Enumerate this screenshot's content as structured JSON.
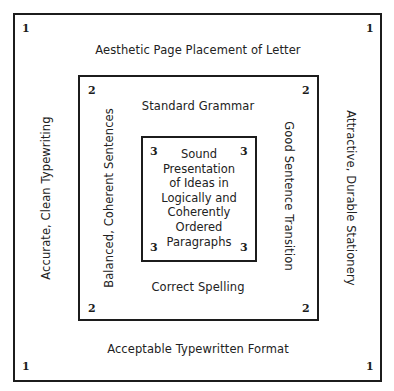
{
  "diagram": {
    "outer": {
      "level": "1",
      "top": "Aesthetic Page Placement of Letter",
      "bottom": "Acceptable Typewritten Format",
      "left": "Accurate, Clean Typewriting",
      "right": "Attractive, Durable Stationery"
    },
    "middle": {
      "level": "2",
      "top": "Standard Grammar",
      "bottom": "Correct Spelling",
      "left": "Balanced, Coherent Sentences",
      "right": "Good Sentence Transition"
    },
    "inner": {
      "level": "3",
      "lines": [
        "Sound",
        "Presentation",
        "of Ideas in",
        "Logically and",
        "Coherently",
        "Ordered",
        "Paragraphs"
      ]
    }
  }
}
